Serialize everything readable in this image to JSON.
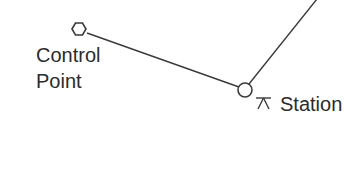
{
  "diagram": {
    "type": "traverse-survey-sketch",
    "nodes": [
      {
        "id": "control_point",
        "symbol": "hexagon-icon",
        "label_lines": [
          "Control",
          "Point"
        ]
      },
      {
        "id": "station",
        "symbol": "circle-with-tripod-icon",
        "label": "Station",
        "tripod_glyph": "⊼"
      }
    ],
    "edges": [
      {
        "from": "control_point",
        "to": "station"
      },
      {
        "from": "station",
        "to": "off-canvas-upper-right"
      }
    ],
    "colors": {
      "line": "#3a3a3a",
      "text": "#2b2b2b",
      "background": "#ffffff"
    }
  }
}
